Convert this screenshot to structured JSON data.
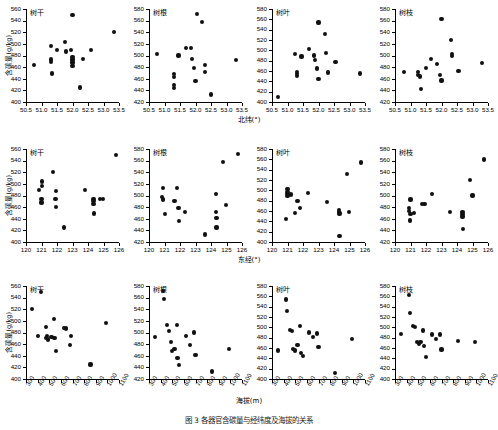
{
  "figure": {
    "caption": "图 3 各器官含碳量与经纬度及海拔的关系",
    "y_axis_label": "含碳量(g/kg)",
    "point_color": "#111111",
    "axis_color": "#000000"
  },
  "rows": [
    {
      "id": "row-latitude",
      "x_axis_label": "北纬(°)",
      "x_ticks": [
        "50.5",
        "51.0",
        "51.5",
        "52.0",
        "52.5",
        "53.0",
        "53.5"
      ],
      "x_min": 50.5,
      "x_max": 53.5,
      "panels": [
        {
          "title": "树干",
          "y_ticks": [
            "400",
            "420",
            "440",
            "460",
            "480",
            "500",
            "520",
            "540",
            "560"
          ],
          "y_min": 400,
          "y_max": 560,
          "points": [
            [
              50.75,
              464
            ],
            [
              51.3,
              497
            ],
            [
              51.3,
              473
            ],
            [
              51.3,
              469
            ],
            [
              51.35,
              449
            ],
            [
              51.5,
              490
            ],
            [
              51.75,
              503
            ],
            [
              51.8,
              487
            ],
            [
              51.95,
              489
            ],
            [
              52.0,
              549
            ],
            [
              52.0,
              477
            ],
            [
              52.0,
              473
            ],
            [
              52.0,
              468
            ],
            [
              52.0,
              462
            ],
            [
              52.25,
              425
            ],
            [
              52.35,
              474
            ],
            [
              52.6,
              489
            ],
            [
              53.35,
              520
            ]
          ]
        },
        {
          "title": "树根",
          "y_ticks": [
            "420",
            "440",
            "460",
            "480",
            "500",
            "520",
            "540",
            "560",
            "580"
          ],
          "y_min": 420,
          "y_max": 580,
          "points": [
            [
              50.75,
              503
            ],
            [
              51.3,
              468
            ],
            [
              51.3,
              463
            ],
            [
              51.3,
              449
            ],
            [
              51.3,
              444
            ],
            [
              51.45,
              500
            ],
            [
              51.7,
              513
            ],
            [
              51.85,
              513
            ],
            [
              51.9,
              494
            ],
            [
              51.95,
              479
            ],
            [
              52.0,
              456
            ],
            [
              52.05,
              572
            ],
            [
              52.2,
              558
            ],
            [
              52.3,
              484
            ],
            [
              52.3,
              472
            ],
            [
              52.5,
              433
            ],
            [
              53.3,
              492
            ]
          ]
        },
        {
          "title": "树叶",
          "y_ticks": [
            "400",
            "420",
            "440",
            "460",
            "480",
            "500",
            "520",
            "540",
            "560",
            "580"
          ],
          "y_min": 400,
          "y_max": 580,
          "points": [
            [
              50.7,
              410
            ],
            [
              51.25,
              493
            ],
            [
              51.3,
              458
            ],
            [
              51.3,
              454
            ],
            [
              51.3,
              451
            ],
            [
              51.45,
              488
            ],
            [
              51.7,
              503
            ],
            [
              51.85,
              490
            ],
            [
              51.9,
              481
            ],
            [
              51.95,
              465
            ],
            [
              52.0,
              554
            ],
            [
              52.0,
              444
            ],
            [
              52.2,
              532
            ],
            [
              52.25,
              495
            ],
            [
              52.3,
              457
            ],
            [
              52.55,
              478
            ],
            [
              53.35,
              455
            ]
          ]
        },
        {
          "title": "树枝",
          "y_ticks": [
            "420",
            "440",
            "460",
            "480",
            "500",
            "520",
            "540",
            "560",
            "580"
          ],
          "y_min": 420,
          "y_max": 580,
          "points": [
            [
              50.8,
              472
            ],
            [
              51.25,
              472
            ],
            [
              51.25,
              467
            ],
            [
              51.3,
              464
            ],
            [
              51.35,
              442
            ],
            [
              51.5,
              478
            ],
            [
              51.65,
              494
            ],
            [
              51.85,
              486
            ],
            [
              51.95,
              467
            ],
            [
              52.0,
              563
            ],
            [
              52.0,
              457
            ],
            [
              52.3,
              527
            ],
            [
              52.35,
              502
            ],
            [
              52.35,
              499
            ],
            [
              52.55,
              473
            ],
            [
              53.3,
              487
            ]
          ]
        }
      ]
    },
    {
      "id": "row-longitude",
      "x_axis_label": "东经(°)",
      "x_ticks": [
        "120",
        "121",
        "122",
        "123",
        "124",
        "125",
        "126"
      ],
      "x_min": 120,
      "x_max": 126,
      "panels": [
        {
          "title": "树干",
          "y_ticks": [
            "400",
            "420",
            "440",
            "460",
            "480",
            "500",
            "520",
            "540",
            "560"
          ],
          "y_min": 400,
          "y_max": 560,
          "points": [
            [
              120.85,
              489
            ],
            [
              121.05,
              504
            ],
            [
              121.05,
              497
            ],
            [
              121.0,
              474
            ],
            [
              121.0,
              468
            ],
            [
              121.75,
              520
            ],
            [
              121.95,
              488
            ],
            [
              121.9,
              474
            ],
            [
              121.95,
              460
            ],
            [
              122.45,
              425
            ],
            [
              123.8,
              489
            ],
            [
              124.35,
              474
            ],
            [
              124.35,
              470
            ],
            [
              124.35,
              466
            ],
            [
              124.4,
              449
            ],
            [
              124.75,
              474
            ],
            [
              124.95,
              474
            ],
            [
              125.8,
              549
            ]
          ]
        },
        {
          "title": "树根",
          "y_ticks": [
            "420",
            "440",
            "460",
            "480",
            "500",
            "520",
            "540",
            "560",
            "580"
          ],
          "y_min": 420,
          "y_max": 580,
          "points": [
            [
              120.9,
              513
            ],
            [
              120.85,
              498
            ],
            [
              120.9,
              494
            ],
            [
              120.9,
              492
            ],
            [
              121.05,
              468
            ],
            [
              121.8,
              513
            ],
            [
              121.65,
              490
            ],
            [
              121.9,
              478
            ],
            [
              121.95,
              456
            ],
            [
              122.3,
              472
            ],
            [
              123.6,
              433
            ],
            [
              124.3,
              503
            ],
            [
              124.3,
              471
            ],
            [
              124.35,
              461
            ],
            [
              124.35,
              445
            ],
            [
              124.8,
              558
            ],
            [
              124.95,
              483
            ],
            [
              125.75,
              572
            ]
          ]
        },
        {
          "title": "树叶",
          "y_ticks": [
            "400",
            "420",
            "440",
            "460",
            "480",
            "500",
            "520",
            "540",
            "560",
            "580"
          ],
          "y_min": 400,
          "y_max": 580,
          "points": [
            [
              121.0,
              503
            ],
            [
              121.0,
              497
            ],
            [
              121.0,
              493
            ],
            [
              121.0,
              489
            ],
            [
              121.25,
              492
            ],
            [
              120.9,
              445
            ],
            [
              121.65,
              480
            ],
            [
              121.8,
              466
            ],
            [
              121.5,
              456
            ],
            [
              122.3,
              495
            ],
            [
              123.55,
              478
            ],
            [
              124.3,
              462
            ],
            [
              124.3,
              458
            ],
            [
              124.35,
              455
            ],
            [
              124.35,
              411
            ],
            [
              124.85,
              532
            ],
            [
              124.95,
              458
            ],
            [
              125.75,
              554
            ]
          ]
        },
        {
          "title": "树枝",
          "y_ticks": [
            "420",
            "440",
            "460",
            "480",
            "500",
            "520",
            "540",
            "560",
            "580"
          ],
          "y_min": 420,
          "y_max": 580,
          "points": [
            [
              121.0,
              493
            ],
            [
              120.9,
              479
            ],
            [
              120.9,
              473
            ],
            [
              121.0,
              468
            ],
            [
              121.2,
              470
            ],
            [
              120.95,
              457
            ],
            [
              121.75,
              486
            ],
            [
              121.9,
              486
            ],
            [
              122.4,
              502
            ],
            [
              123.55,
              472
            ],
            [
              124.35,
              472
            ],
            [
              124.35,
              468
            ],
            [
              124.35,
              464
            ],
            [
              124.4,
              442
            ],
            [
              124.85,
              527
            ],
            [
              125.0,
              500
            ],
            [
              125.75,
              562
            ]
          ]
        }
      ]
    },
    {
      "id": "row-elevation",
      "x_axis_label": "海拔(m)",
      "x_ticks": [
        "300",
        "400",
        "500",
        "600",
        "700",
        "800",
        "900",
        "1000",
        "1100"
      ],
      "x_min": 300,
      "x_max": 1100,
      "panels": [
        {
          "title": "树干",
          "y_ticks": [
            "400",
            "420",
            "440",
            "460",
            "480",
            "500",
            "520",
            "540",
            "560"
          ],
          "y_min": 400,
          "y_max": 560,
          "points": [
            [
              350,
              520
            ],
            [
              430,
              549
            ],
            [
              400,
              474
            ],
            [
              470,
              489
            ],
            [
              480,
              474
            ],
            [
              470,
              470
            ],
            [
              490,
              468
            ],
            [
              520,
              472
            ],
            [
              540,
              503
            ],
            [
              545,
              470
            ],
            [
              560,
              448
            ],
            [
              625,
              488
            ],
            [
              645,
              487
            ],
            [
              690,
              474
            ],
            [
              680,
              459
            ],
            [
              855,
              425
            ],
            [
              990,
              497
            ]
          ]
        },
        {
          "title": "树根",
          "y_ticks": [
            "420",
            "440",
            "460",
            "480",
            "500",
            "520",
            "540",
            "560",
            "580"
          ],
          "y_min": 420,
          "y_max": 580,
          "points": [
            [
              350,
              492
            ],
            [
              420,
              572
            ],
            [
              430,
              558
            ],
            [
              455,
              513
            ],
            [
              470,
              503
            ],
            [
              490,
              484
            ],
            [
              500,
              468
            ],
            [
              520,
              472
            ],
            [
              540,
              513
            ],
            [
              545,
              456
            ],
            [
              560,
              444
            ],
            [
              620,
              494
            ],
            [
              650,
              479
            ],
            [
              690,
              500
            ],
            [
              700,
              461
            ],
            [
              840,
              433
            ],
            [
              990,
              471
            ]
          ]
        },
        {
          "title": "树叶",
          "y_ticks": [
            "400",
            "420",
            "440",
            "460",
            "480",
            "500",
            "520",
            "540",
            "560",
            "580"
          ],
          "y_min": 400,
          "y_max": 580,
          "points": [
            [
              350,
              455
            ],
            [
              420,
              554
            ],
            [
              430,
              532
            ],
            [
              455,
              495
            ],
            [
              470,
              493
            ],
            [
              480,
              458
            ],
            [
              500,
              455
            ],
            [
              520,
              466
            ],
            [
              540,
              503
            ],
            [
              550,
              451
            ],
            [
              565,
              444
            ],
            [
              620,
              490
            ],
            [
              650,
              481
            ],
            [
              690,
              488
            ],
            [
              700,
              462
            ],
            [
              845,
              411
            ],
            [
              990,
              478
            ]
          ]
        },
        {
          "title": "树枝",
          "y_ticks": [
            "400",
            "420",
            "440",
            "460",
            "480",
            "500",
            "520",
            "540",
            "560",
            "580"
          ],
          "y_min": 400,
          "y_max": 580,
          "points": [
            [
              350,
              487
            ],
            [
              420,
              563
            ],
            [
              430,
              527
            ],
            [
              455,
              502
            ],
            [
              470,
              500
            ],
            [
              490,
              472
            ],
            [
              505,
              467
            ],
            [
              520,
              472
            ],
            [
              540,
              494
            ],
            [
              550,
              464
            ],
            [
              565,
              442
            ],
            [
              620,
              486
            ],
            [
              650,
              478
            ],
            [
              690,
              486
            ],
            [
              700,
              457
            ],
            [
              845,
              473
            ],
            [
              990,
              472
            ]
          ]
        }
      ]
    }
  ],
  "chart_data": {
    "type": "scatter",
    "title": "各器官含碳量与经纬度及海拔的关系",
    "ylabel": "含碳量(g/kg)",
    "grid": false,
    "legend": "none",
    "layout": "3 rows x 4 columns",
    "row_variables": [
      "北纬(°)",
      "东经(°)",
      "海拔(m)"
    ],
    "column_organs": [
      "树干",
      "树根",
      "树叶",
      "树枝"
    ]
  }
}
